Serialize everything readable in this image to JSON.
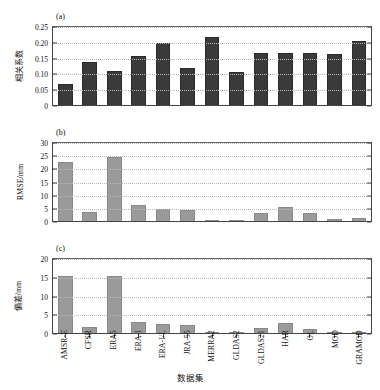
{
  "chart_data": {
    "type": "bar",
    "title": "",
    "xlabel": "数据集",
    "grid": "horizontal-dotted",
    "legend": "none",
    "categories": [
      "AMSR-E",
      "CFSR",
      "ERA5",
      "ERA-I",
      "ERA-I/L",
      "JRA-55",
      "MERRA2",
      "GLDAS2",
      "GLDAS21",
      "HAR",
      "OL",
      "MOD",
      "GRAMOD"
    ],
    "panels": [
      {
        "tag": "(a)",
        "ylabel": "相关系数",
        "ylim": [
          0,
          0.25
        ],
        "yticks": [
          "0",
          "0.05",
          "0.10",
          "0.15",
          "0.20",
          "0.25"
        ],
        "ytick_values": [
          0,
          0.05,
          0.1,
          0.15,
          0.2,
          0.25
        ],
        "bar_color": "#3a3a3a",
        "values": [
          0.07,
          0.14,
          0.11,
          0.158,
          0.199,
          0.119,
          0.218,
          0.108,
          0.167,
          0.167,
          0.167,
          0.166,
          0.206
        ]
      },
      {
        "tag": "(b)",
        "ylabel": "RMSE/mm",
        "ylim": [
          0,
          30
        ],
        "yticks": [
          "0",
          "5",
          "10",
          "15",
          "20",
          "25",
          "30"
        ],
        "ytick_values": [
          0,
          5,
          10,
          15,
          20,
          25,
          30
        ],
        "bar_color": "#9a9a9a",
        "values": [
          22.8,
          3.8,
          24.8,
          6.5,
          5.1,
          4.7,
          0.9,
          0.5,
          3.3,
          5.8,
          3.6,
          1.2,
          1.4
        ]
      },
      {
        "tag": "(c)",
        "ylabel": "偏差/mm",
        "ylim": [
          0,
          20
        ],
        "yticks": [
          "0",
          "5",
          "10",
          "15",
          "20"
        ],
        "ytick_values": [
          0,
          5,
          10,
          15,
          20
        ],
        "bar_color": "#9a9a9a",
        "values": [
          15.6,
          1.9,
          15.5,
          3.2,
          2.8,
          2.4,
          0.5,
          0.35,
          1.5,
          2.9,
          1.4,
          0.3,
          0.45
        ]
      }
    ]
  }
}
